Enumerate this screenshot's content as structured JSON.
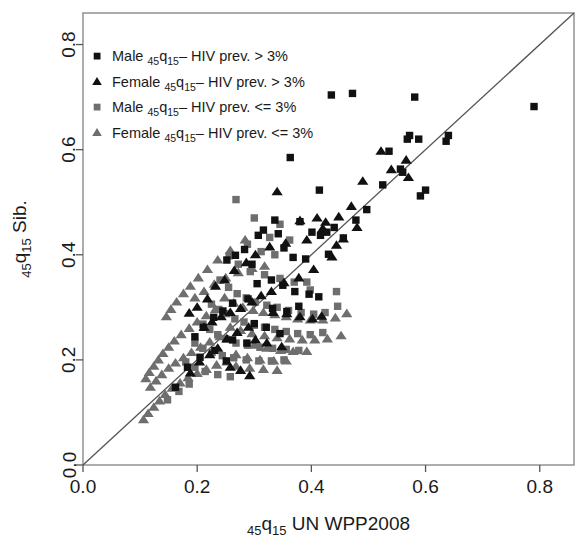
{
  "chart_data": {
    "type": "scatter",
    "title": "",
    "xlabel": "45q15 UN WPP2008",
    "ylabel": "45q15 Sib.",
    "xlabel_parts": {
      "sub1": "45",
      "main1": "q",
      "sub2": "15",
      "rest": " UN WPP2008"
    },
    "ylabel_parts": {
      "sub1": "45",
      "main1": "q",
      "sub2": "15",
      "rest": " Sib."
    },
    "xlim": [
      0.0,
      0.86
    ],
    "ylim": [
      0.0,
      0.86
    ],
    "xticks": [
      0.0,
      0.2,
      0.4,
      0.6,
      0.8
    ],
    "yticks": [
      0.0,
      0.2,
      0.4,
      0.6,
      0.8
    ],
    "xtick_labels": [
      "0.0",
      "0.2",
      "0.4",
      "0.6",
      "0.8"
    ],
    "ytick_labels": [
      "0.0",
      "0.2",
      "0.4",
      "0.6",
      "0.8"
    ],
    "grid": false,
    "reference_line": {
      "type": "identity",
      "from": [
        0.0,
        0.0
      ],
      "to": [
        0.86,
        0.86
      ],
      "color": "#555555"
    },
    "legend_position": "top-left",
    "colors": {
      "high_prev": "#111111",
      "low_prev": "#6e6e6e",
      "frame": "#8a8a8a",
      "line": "#555555"
    },
    "series": [
      {
        "name": "Male 45q15- HIV prev. > 3%",
        "legend_label_main": "Male ",
        "legend_label_rest": "– HIV prev. > 3%",
        "marker": "square",
        "color": "#111111",
        "points": [
          [
            0.363,
            0.585
          ],
          [
            0.414,
            0.523
          ],
          [
            0.435,
            0.704
          ],
          [
            0.472,
            0.707
          ],
          [
            0.525,
            0.533
          ],
          [
            0.536,
            0.597
          ],
          [
            0.556,
            0.563
          ],
          [
            0.56,
            0.557
          ],
          [
            0.568,
            0.62
          ],
          [
            0.572,
            0.627
          ],
          [
            0.581,
            0.7
          ],
          [
            0.588,
            0.62
          ],
          [
            0.591,
            0.512
          ],
          [
            0.6,
            0.523
          ],
          [
            0.636,
            0.616
          ],
          [
            0.64,
            0.627
          ],
          [
            0.79,
            0.682
          ],
          [
            0.401,
            0.443
          ],
          [
            0.416,
            0.437
          ],
          [
            0.427,
            0.443
          ],
          [
            0.43,
            0.401
          ],
          [
            0.44,
            0.452
          ],
          [
            0.456,
            0.432
          ],
          [
            0.38,
            0.463
          ],
          [
            0.336,
            0.466
          ],
          [
            0.342,
            0.44
          ],
          [
            0.307,
            0.437
          ],
          [
            0.316,
            0.447
          ],
          [
            0.352,
            0.413
          ],
          [
            0.368,
            0.395
          ],
          [
            0.39,
            0.392
          ],
          [
            0.252,
            0.39
          ],
          [
            0.267,
            0.399
          ],
          [
            0.296,
            0.382
          ],
          [
            0.283,
            0.41
          ],
          [
            0.305,
            0.345
          ],
          [
            0.33,
            0.352
          ],
          [
            0.35,
            0.342
          ],
          [
            0.371,
            0.33
          ],
          [
            0.396,
            0.325
          ],
          [
            0.413,
            0.32
          ],
          [
            0.289,
            0.316
          ],
          [
            0.262,
            0.308
          ],
          [
            0.245,
            0.293
          ],
          [
            0.229,
            0.281
          ],
          [
            0.211,
            0.262
          ],
          [
            0.196,
            0.244
          ],
          [
            0.332,
            0.298
          ],
          [
            0.357,
            0.292
          ],
          [
            0.378,
            0.302
          ],
          [
            0.3,
            0.269
          ],
          [
            0.321,
            0.262
          ],
          [
            0.262,
            0.238
          ],
          [
            0.287,
            0.232
          ],
          [
            0.345,
            0.25
          ],
          [
            0.231,
            0.218
          ],
          [
            0.205,
            0.205
          ],
          [
            0.183,
            0.186
          ],
          [
            0.251,
            0.198
          ],
          [
            0.162,
            0.148
          ],
          [
            0.497,
            0.486
          ],
          [
            0.478,
            0.466
          ]
        ]
      },
      {
        "name": "Female 45q15- HIV prev. > 3%",
        "legend_label_main": "Female ",
        "legend_label_rest": "– HIV prev. > 3%",
        "marker": "triangle",
        "color": "#111111",
        "points": [
          [
            0.34,
            0.52
          ],
          [
            0.38,
            0.465
          ],
          [
            0.41,
            0.47
          ],
          [
            0.425,
            0.462
          ],
          [
            0.49,
            0.54
          ],
          [
            0.522,
            0.597
          ],
          [
            0.54,
            0.562
          ],
          [
            0.566,
            0.58
          ],
          [
            0.57,
            0.547
          ],
          [
            0.42,
            0.45
          ],
          [
            0.392,
            0.428
          ],
          [
            0.355,
            0.422
          ],
          [
            0.327,
            0.415
          ],
          [
            0.302,
            0.4
          ],
          [
            0.286,
            0.385
          ],
          [
            0.265,
            0.37
          ],
          [
            0.248,
            0.352
          ],
          [
            0.232,
            0.34
          ],
          [
            0.218,
            0.316
          ],
          [
            0.2,
            0.3
          ],
          [
            0.186,
            0.289
          ],
          [
            0.47,
            0.492
          ],
          [
            0.448,
            0.472
          ],
          [
            0.456,
            0.43
          ],
          [
            0.436,
            0.396
          ],
          [
            0.404,
            0.372
          ],
          [
            0.378,
            0.356
          ],
          [
            0.352,
            0.347
          ],
          [
            0.33,
            0.33
          ],
          [
            0.312,
            0.322
          ],
          [
            0.296,
            0.31
          ],
          [
            0.276,
            0.298
          ],
          [
            0.258,
            0.29
          ],
          [
            0.242,
            0.282
          ],
          [
            0.226,
            0.272
          ],
          [
            0.212,
            0.262
          ],
          [
            0.333,
            0.29
          ],
          [
            0.357,
            0.288
          ],
          [
            0.38,
            0.282
          ],
          [
            0.402,
            0.278
          ],
          [
            0.418,
            0.283
          ],
          [
            0.29,
            0.262
          ],
          [
            0.27,
            0.252
          ],
          [
            0.252,
            0.24
          ],
          [
            0.302,
            0.238
          ],
          [
            0.322,
            0.232
          ],
          [
            0.348,
            0.225
          ],
          [
            0.236,
            0.222
          ],
          [
            0.222,
            0.21
          ],
          [
            0.204,
            0.196
          ],
          [
            0.258,
            0.186
          ],
          [
            0.276,
            0.18
          ],
          [
            0.292,
            0.17
          ],
          [
            0.188,
            0.175
          ],
          [
            0.444,
            0.418
          ],
          [
            0.48,
            0.452
          ]
        ]
      },
      {
        "name": "Male 45q15- HIV prev. <= 3%",
        "legend_label_main": "Male ",
        "legend_label_rest": "– HIV prev. <= 3%",
        "marker": "square",
        "color": "#6e6e6e",
        "points": [
          [
            0.268,
            0.505
          ],
          [
            0.3,
            0.47
          ],
          [
            0.345,
            0.458
          ],
          [
            0.327,
            0.433
          ],
          [
            0.362,
            0.428
          ],
          [
            0.288,
            0.42
          ],
          [
            0.312,
            0.406
          ],
          [
            0.336,
            0.4
          ],
          [
            0.256,
            0.398
          ],
          [
            0.272,
            0.382
          ],
          [
            0.293,
            0.368
          ],
          [
            0.318,
            0.362
          ],
          [
            0.345,
            0.355
          ],
          [
            0.37,
            0.348
          ],
          [
            0.392,
            0.348
          ],
          [
            0.24,
            0.352
          ],
          [
            0.255,
            0.338
          ],
          [
            0.27,
            0.326
          ],
          [
            0.286,
            0.318
          ],
          [
            0.302,
            0.31
          ],
          [
            0.322,
            0.304
          ],
          [
            0.34,
            0.3
          ],
          [
            0.36,
            0.294
          ],
          [
            0.382,
            0.29
          ],
          [
            0.404,
            0.287
          ],
          [
            0.424,
            0.29
          ],
          [
            0.446,
            0.302
          ],
          [
            0.225,
            0.306
          ],
          [
            0.238,
            0.296
          ],
          [
            0.252,
            0.288
          ],
          [
            0.266,
            0.278
          ],
          [
            0.282,
            0.272
          ],
          [
            0.3,
            0.266
          ],
          [
            0.318,
            0.262
          ],
          [
            0.336,
            0.258
          ],
          [
            0.356,
            0.254
          ],
          [
            0.376,
            0.25
          ],
          [
            0.398,
            0.248
          ],
          [
            0.42,
            0.252
          ],
          [
            0.21,
            0.268
          ],
          [
            0.222,
            0.258
          ],
          [
            0.236,
            0.248
          ],
          [
            0.25,
            0.24
          ],
          [
            0.268,
            0.232
          ],
          [
            0.288,
            0.228
          ],
          [
            0.31,
            0.224
          ],
          [
            0.332,
            0.222
          ],
          [
            0.356,
            0.22
          ],
          [
            0.378,
            0.218
          ],
          [
            0.196,
            0.232
          ],
          [
            0.21,
            0.222
          ],
          [
            0.226,
            0.214
          ],
          [
            0.244,
            0.208
          ],
          [
            0.264,
            0.204
          ],
          [
            0.286,
            0.2
          ],
          [
            0.308,
            0.198
          ],
          [
            0.33,
            0.198
          ],
          [
            0.352,
            0.2
          ],
          [
            0.18,
            0.196
          ],
          [
            0.196,
            0.186
          ],
          [
            0.214,
            0.178
          ],
          [
            0.236,
            0.172
          ],
          [
            0.258,
            0.168
          ],
          [
            0.148,
            0.124
          ],
          [
            0.168,
            0.14
          ],
          [
            0.186,
            0.154
          ],
          [
            0.444,
            0.33
          ],
          [
            0.398,
            0.333
          ]
        ]
      },
      {
        "name": "Female 45q15- HIV prev. <= 3%",
        "legend_label_main": "Female ",
        "legend_label_rest": "– HIV prev. <= 3%",
        "marker": "triangle",
        "color": "#6e6e6e",
        "points": [
          [
            0.284,
            0.428
          ],
          [
            0.258,
            0.408
          ],
          [
            0.236,
            0.39
          ],
          [
            0.218,
            0.372
          ],
          [
            0.202,
            0.356
          ],
          [
            0.188,
            0.34
          ],
          [
            0.176,
            0.326
          ],
          [
            0.164,
            0.31
          ],
          [
            0.154,
            0.296
          ],
          [
            0.146,
            0.282
          ],
          [
            0.196,
            0.318
          ],
          [
            0.212,
            0.33
          ],
          [
            0.23,
            0.344
          ],
          [
            0.25,
            0.356
          ],
          [
            0.272,
            0.366
          ],
          [
            0.296,
            0.374
          ],
          [
            0.318,
            0.378
          ],
          [
            0.248,
            0.318
          ],
          [
            0.264,
            0.308
          ],
          [
            0.28,
            0.3
          ],
          [
            0.298,
            0.294
          ],
          [
            0.316,
            0.29
          ],
          [
            0.336,
            0.286
          ],
          [
            0.356,
            0.282
          ],
          [
            0.376,
            0.278
          ],
          [
            0.398,
            0.276
          ],
          [
            0.42,
            0.276
          ],
          [
            0.442,
            0.28
          ],
          [
            0.462,
            0.288
          ],
          [
            0.232,
            0.296
          ],
          [
            0.216,
            0.284
          ],
          [
            0.2,
            0.272
          ],
          [
            0.186,
            0.26
          ],
          [
            0.172,
            0.248
          ],
          [
            0.16,
            0.236
          ],
          [
            0.15,
            0.224
          ],
          [
            0.14,
            0.212
          ],
          [
            0.132,
            0.2
          ],
          [
            0.124,
            0.188
          ],
          [
            0.116,
            0.176
          ],
          [
            0.11,
            0.164
          ],
          [
            0.258,
            0.262
          ],
          [
            0.276,
            0.256
          ],
          [
            0.296,
            0.25
          ],
          [
            0.318,
            0.246
          ],
          [
            0.34,
            0.242
          ],
          [
            0.362,
            0.24
          ],
          [
            0.384,
            0.238
          ],
          [
            0.406,
            0.238
          ],
          [
            0.428,
            0.24
          ],
          [
            0.452,
            0.246
          ],
          [
            0.24,
            0.244
          ],
          [
            0.222,
            0.234
          ],
          [
            0.206,
            0.224
          ],
          [
            0.19,
            0.214
          ],
          [
            0.176,
            0.204
          ],
          [
            0.162,
            0.194
          ],
          [
            0.15,
            0.184
          ],
          [
            0.138,
            0.172
          ],
          [
            0.128,
            0.16
          ],
          [
            0.118,
            0.148
          ],
          [
            0.3,
            0.228
          ],
          [
            0.322,
            0.222
          ],
          [
            0.346,
            0.218
          ],
          [
            0.368,
            0.216
          ],
          [
            0.392,
            0.216
          ],
          [
            0.268,
            0.21
          ],
          [
            0.288,
            0.204
          ],
          [
            0.31,
            0.2
          ],
          [
            0.334,
            0.198
          ],
          [
            0.356,
            0.198
          ],
          [
            0.252,
            0.196
          ],
          [
            0.234,
            0.19
          ],
          [
            0.216,
            0.182
          ],
          [
            0.2,
            0.174
          ],
          [
            0.184,
            0.166
          ],
          [
            0.17,
            0.156
          ],
          [
            0.156,
            0.146
          ],
          [
            0.144,
            0.134
          ],
          [
            0.134,
            0.122
          ],
          [
            0.124,
            0.11
          ],
          [
            0.114,
            0.098
          ],
          [
            0.106,
            0.086
          ],
          [
            0.268,
            0.188
          ],
          [
            0.292,
            0.184
          ],
          [
            0.316,
            0.182
          ],
          [
            0.34,
            0.18
          ]
        ]
      }
    ]
  },
  "legend": {
    "items": [
      {
        "marker": "square",
        "color": "#111111",
        "prefix": "Male ",
        "suffix": "– HIV prev. > 3%"
      },
      {
        "marker": "triangle",
        "color": "#111111",
        "prefix": "Female ",
        "suffix": "– HIV prev. > 3%"
      },
      {
        "marker": "square",
        "color": "#6e6e6e",
        "prefix": "Male ",
        "suffix": "– HIV prev. <= 3%"
      },
      {
        "marker": "triangle",
        "color": "#6e6e6e",
        "prefix": "Female ",
        "suffix": "– HIV prev. <= 3%"
      }
    ],
    "sub_45": "45",
    "q": "q",
    "sub_15": "15"
  }
}
